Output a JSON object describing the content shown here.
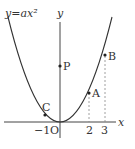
{
  "diagram": {
    "curve_label": "y=ax²",
    "axis_x_label": "x",
    "axis_y_label": "y",
    "origin_label": "O",
    "points": [
      {
        "name": "C",
        "x": -1
      },
      {
        "name": "A",
        "x": 2
      },
      {
        "name": "B",
        "x": 3
      },
      {
        "name": "P",
        "x": 0
      }
    ],
    "tick_labels": [
      "−1",
      "2",
      "3"
    ],
    "colors": {
      "line": "#333333",
      "dashed": "#888888"
    }
  }
}
